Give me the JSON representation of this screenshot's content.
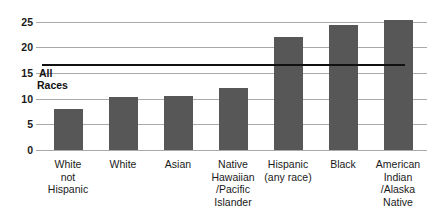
{
  "chart_data": {
    "type": "bar",
    "title": "",
    "xlabel": "",
    "ylabel": "",
    "ylim": [
      0,
      27
    ],
    "grid": true,
    "legend": "none",
    "categories": [
      "White\nnot\nHispanic",
      "White",
      "Asian",
      "Native\nHawaiian\n/Pacific\nIslander",
      "Hispanic\n(any race)",
      "Black",
      "American\nIndian\n/Alaska\nNative"
    ],
    "category_lines": [
      [
        "White",
        "not",
        "Hispanic"
      ],
      [
        "White"
      ],
      [
        "Asian"
      ],
      [
        "Native",
        "Hawaiian",
        "/Pacific",
        "Islander"
      ],
      [
        "Hispanic",
        "(any race)"
      ],
      [
        "Black"
      ],
      [
        "American",
        "Indian",
        "/Alaska",
        "Native"
      ]
    ],
    "values": [
      8.0,
      10.4,
      10.6,
      12.1,
      22.0,
      24.5,
      25.4
    ],
    "yticks": [
      0,
      5,
      10,
      15,
      20,
      25
    ],
    "ytick_labels": [
      "0",
      "5",
      "10",
      "15",
      "20",
      "25"
    ],
    "bar_color": "#575757",
    "gridline_color": "#a9a9a9",
    "annotations": [
      {
        "name": "all-races-reference-line",
        "label_lines": [
          "All",
          "Races"
        ],
        "value": 14.0,
        "color": "#111111"
      }
    ]
  }
}
